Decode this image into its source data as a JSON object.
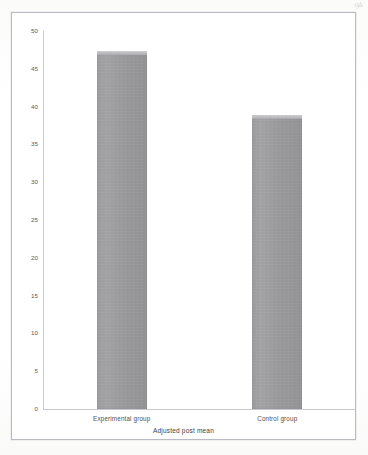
{
  "page": {
    "corner_mark": "94",
    "background_color": "#fdfdfc",
    "frame_border_color": "#b9bac4"
  },
  "chart_data": {
    "type": "bar",
    "title": "",
    "subtitle": "",
    "xlabel": "Adjusted post mean",
    "ylabel": "",
    "categories": [
      "Experimental group",
      "Control group"
    ],
    "values": [
      47.3,
      38.9
    ],
    "series": [
      {
        "name": "Adjusted post mean",
        "values": [
          47.3,
          38.9
        ]
      }
    ],
    "ylim": [
      0,
      50
    ],
    "yticks": [
      0,
      5,
      10,
      15,
      20,
      25,
      30,
      35,
      40,
      45,
      50
    ],
    "ytick_labels": [
      "0",
      "5",
      "10",
      "15",
      "20",
      "25",
      "30",
      "35",
      "40",
      "45",
      "50"
    ],
    "grid": false,
    "legend": false,
    "legend_position": "none",
    "bar_color": "#9a9a9c",
    "bar_highlight_color": "#cfcfd1",
    "axis_color": "#c9cad1",
    "tick_label_color": "#58585a"
  }
}
